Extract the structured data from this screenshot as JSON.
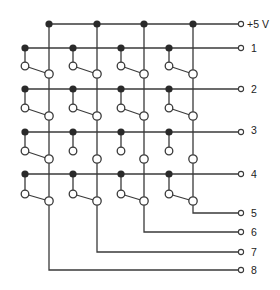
{
  "diagram": {
    "colors": {
      "wire": "#3a3a3a",
      "node": "#2a2a2a",
      "background": "#ffffff"
    },
    "supply": {
      "label": "+5 V",
      "y": 24,
      "x_start": 49,
      "terminal_x": 241
    },
    "columns": [
      {
        "x": 49,
        "output_label": "8",
        "output_y": 270
      },
      {
        "x": 97,
        "output_label": "7",
        "output_y": 252
      },
      {
        "x": 144,
        "output_label": "6",
        "output_y": 232
      },
      {
        "x": 193,
        "output_label": "5",
        "output_y": 213
      }
    ],
    "row_node_x": [
      25,
      73,
      121,
      169
    ],
    "rows": [
      {
        "label": "1",
        "y": 48,
        "upper_contact_y": 66,
        "lower_contact_y": 74,
        "levers": [
          true,
          true,
          true,
          true
        ]
      },
      {
        "label": "2",
        "y": 89,
        "upper_contact_y": 108,
        "lower_contact_y": 116,
        "levers": [
          true,
          true,
          true,
          true
        ]
      },
      {
        "label": "3",
        "y": 132,
        "upper_contact_y": 151,
        "lower_contact_y": 159,
        "levers": [
          true,
          false,
          false,
          false
        ]
      },
      {
        "label": "4",
        "y": 174,
        "upper_contact_y": 194,
        "lower_contact_y": 201,
        "levers": [
          true,
          true,
          true,
          true
        ]
      }
    ],
    "terminal_x": 241,
    "label_x": 251
  }
}
